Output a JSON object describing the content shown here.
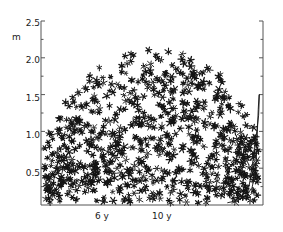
{
  "figure": {
    "background_color": "#ffffff",
    "ink_color": "#141414",
    "axis_color": "#555555",
    "width": 283,
    "height": 232
  },
  "axes": {
    "y_axis": {
      "label": "m",
      "tick_labels": [
        "2.5",
        "2.0",
        "1.5",
        "1.0",
        "0.5"
      ],
      "tick_values": [
        2.5,
        2.0,
        1.5,
        1.0,
        0.5
      ],
      "minor_ticks": true,
      "limits": [
        0.0,
        2.5
      ],
      "position": "left"
    },
    "x_axis": {
      "tick_labels": [
        "6 y",
        "10 y"
      ],
      "tick_values": [
        6,
        10
      ],
      "limits": [
        2.2,
        13.4
      ],
      "position": "bottom"
    },
    "right_axis": {
      "visible": true,
      "ticks": true,
      "minor_ticks": true,
      "limits": [
        0.0,
        2.5
      ]
    }
  },
  "chart_data": {
    "type": "scatter",
    "title": "",
    "xlabel": "",
    "ylabel": "m",
    "xlim": [
      2.2,
      13.4
    ],
    "ylim": [
      0.0,
      2.5
    ],
    "grid": false,
    "legend": "none",
    "marker": "six-pointed-star",
    "marker_color": "#141414",
    "marker_size_px": 6,
    "point_count": 760,
    "cloud_shape": "dome",
    "annotations": [],
    "series": [
      {
        "name": "scatter-cloud",
        "type": "scatter",
        "marker": "six-pointed-star",
        "description": "Dome-shaped dense cloud of star markers spanning x 2.4 to 13.1, y 0.02 to 2.12, upper envelope arch peaking near y=2.1 around x=7.5-9.5, lower edge at y~0.03."
      },
      {
        "name": "edge-curve",
        "type": "line",
        "color": "#141414",
        "x": [
          11.6,
          12.1,
          12.55,
          12.85,
          13.02,
          13.08,
          13.12,
          13.16,
          13.2,
          13.22,
          13.18,
          13.05,
          12.9,
          12.75,
          12.6
        ],
        "y": [
          0.03,
          0.06,
          0.12,
          0.24,
          0.45,
          0.72,
          1.02,
          1.3,
          1.5,
          1.5,
          1.22,
          0.92,
          0.62,
          0.34,
          0.12
        ],
        "description": "Narrow hairpin curve at right edge rising from baseline to a flat top near y=1.5 then descending back toward baseline."
      }
    ]
  }
}
